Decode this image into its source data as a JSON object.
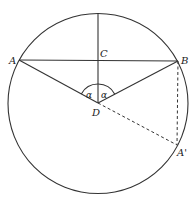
{
  "diagram": {
    "type": "geometry",
    "labels": {
      "A": "A",
      "B": "B",
      "C": "C",
      "D": "D",
      "A_prime": "A'",
      "alpha_left": "α",
      "alpha_right": "α"
    },
    "points": {
      "A": [
        19,
        60
      ],
      "B": [
        178,
        61
      ],
      "C": [
        98,
        60
      ],
      "D": [
        98,
        103
      ],
      "A_prime": [
        177,
        145
      ],
      "top": [
        98,
        9
      ]
    },
    "circle": {
      "cx": 98,
      "cy": 103.5,
      "r": 90
    },
    "colors": {
      "line": "#333333",
      "text": "#222222",
      "background": "#ffffff"
    }
  }
}
